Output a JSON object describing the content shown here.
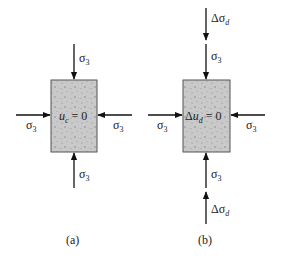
{
  "diagram": {
    "panels": [
      {
        "id": "a",
        "caption": "(a)",
        "specimen_label": {
          "symbol": "u",
          "subscript": "c",
          "rest": " = 0"
        },
        "loads": {
          "top": [
            "σ3"
          ],
          "bottom": [
            "σ3"
          ],
          "left": "σ3",
          "right": "σ3"
        }
      },
      {
        "id": "b",
        "caption": "(b)",
        "specimen_label": {
          "prefix": "Δ",
          "symbol": "u",
          "subscript": "d",
          "rest": " = 0"
        },
        "loads": {
          "top": [
            "Δσd",
            "σ3"
          ],
          "bottom": [
            "σ3",
            "Δσd"
          ],
          "left": "σ3",
          "right": "σ3"
        }
      }
    ],
    "text": {
      "sigma": "σ",
      "three": "3",
      "delta": "Δ",
      "d": "d",
      "caption_a": "(a)",
      "caption_b": "(b)",
      "a_label_u": "u",
      "a_label_sub": "c",
      "a_label_rest": " = 0",
      "b_label_delta": "Δ",
      "b_label_u": "u",
      "b_label_sub": "d",
      "b_label_rest": " = 0"
    },
    "colors": {
      "specimen_fill": "#c9c9c9",
      "specimen_stroke": "#555555",
      "arrow": "#111111",
      "background": "#ffffff"
    }
  }
}
